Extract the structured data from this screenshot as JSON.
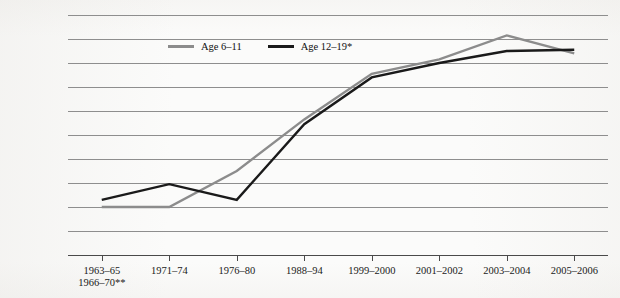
{
  "chart_data": {
    "type": "line",
    "title": "",
    "xlabel": "",
    "ylabel": "Percentage",
    "ylim": [
      0,
      20
    ],
    "ytick_step": 2,
    "yticks": [
      0,
      2,
      4,
      6,
      8,
      10,
      12,
      14,
      16,
      18,
      20
    ],
    "grid": true,
    "legend_position": "top-left-inside",
    "categories": [
      "1963–65\n1966–70**",
      "1971–74",
      "1976–80",
      "1988–94",
      "1999–2000",
      "2001–2002",
      "2003–2004",
      "2005–2006"
    ],
    "category_lines": [
      [
        "1963–65",
        "1966–70**"
      ],
      [
        "1971–74",
        ""
      ],
      [
        "1976–80",
        ""
      ],
      [
        "1988–94",
        ""
      ],
      [
        "1999–2000",
        ""
      ],
      [
        "2001–2002",
        ""
      ],
      [
        "2003–2004",
        ""
      ],
      [
        "2005–2006",
        ""
      ]
    ],
    "series": [
      {
        "name": "Age 6–11",
        "color": "#8c8c8c",
        "values": [
          4.0,
          4.0,
          7.0,
          11.3,
          15.1,
          16.3,
          18.3,
          16.8
        ]
      },
      {
        "name": "Age 12–19*",
        "color": "#1a1a1a",
        "values": [
          4.6,
          5.9,
          4.6,
          10.9,
          14.8,
          16.0,
          17.0,
          17.1
        ]
      }
    ]
  },
  "legend": {
    "items": [
      {
        "label": "Age 6–11",
        "color": "#8c8c8c"
      },
      {
        "label": "Age 12–19*",
        "color": "#1a1a1a"
      }
    ]
  },
  "axes": {
    "y_title": "Percentage",
    "y_labels": [
      "20",
      "18",
      "16",
      "14",
      "12",
      "10",
      "8",
      "6",
      "4",
      "2",
      "0"
    ],
    "x_labels": [
      {
        "line1": "1963–65",
        "line2": "1966–70**"
      },
      {
        "line1": "1971–74",
        "line2": ""
      },
      {
        "line1": "1976–80",
        "line2": ""
      },
      {
        "line1": "1988–94",
        "line2": ""
      },
      {
        "line1": "1999–2000",
        "line2": ""
      },
      {
        "line1": "2001–2002",
        "line2": ""
      },
      {
        "line1": "2003–2004",
        "line2": ""
      },
      {
        "line1": "2005–2006",
        "line2": ""
      }
    ]
  }
}
